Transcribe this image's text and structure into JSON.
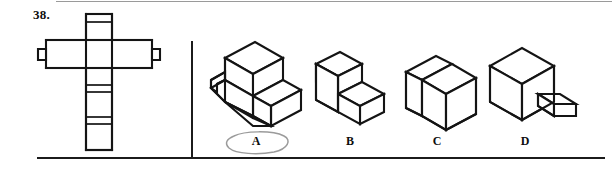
{
  "exercise": {
    "number_label": "38.",
    "kind": "orthographic-to-isometric matching",
    "selected_option": "A",
    "selection_mark": "hand-drawn-ellipse"
  },
  "orthographic_view": {
    "name": "cross-shaped-multiview",
    "description": "Cross / plus shaped outline: tall vertical stem crossed by a wide horizontal arm with small tabs projecting from both ends; stem divided by several horizontal lines."
  },
  "options": [
    {
      "id": "A",
      "label": "A",
      "name": "isometric-solid-a",
      "description": "Stepped L-shaped block: tall upright slab at rear with lower ledge at front right and notch at front left",
      "selected": true
    },
    {
      "id": "B",
      "label": "B",
      "name": "isometric-solid-b",
      "description": "Two-step staircase block descending left to right",
      "selected": false
    },
    {
      "id": "C",
      "label": "C",
      "name": "isometric-solid-c",
      "description": "House / barn shape: rectangular prism with peaked gable roof",
      "selected": false
    },
    {
      "id": "D",
      "label": "D",
      "name": "isometric-solid-d",
      "description": "Cube with small rectangular tab projecting from the right face",
      "selected": false
    }
  ],
  "colors": {
    "ink_black": "#141414",
    "rule_gray": "#9a9a9a",
    "pen_gray": "#9b9b9b",
    "paper": "#ffffff"
  }
}
